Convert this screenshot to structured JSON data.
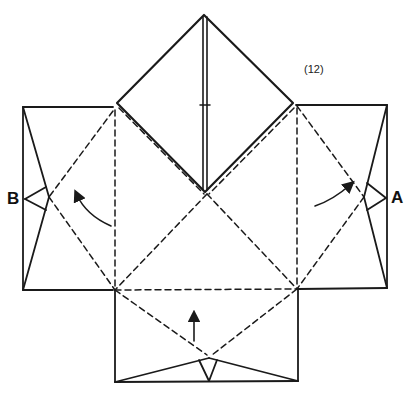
{
  "diagram": {
    "type": "origami-folding-step",
    "step_number": "(12)",
    "labels": {
      "left_point": "B",
      "right_point": "A"
    },
    "colors": {
      "line": "#1a1a1a",
      "background": "#ffffff"
    },
    "elements": {
      "top_diamond": "folded square flap with center crease",
      "left_panel": "rectangle with point B folded inward",
      "right_panel": "rectangle with point A folded inward",
      "bottom_panel": "rectangle with bottom point folded up",
      "valley_folds": "dashed diagonal fold lines forming a square",
      "arrows": [
        "curved arrow left (fold B in)",
        "curved arrow right (fold A in)",
        "straight arrow up (fold bottom up)"
      ]
    }
  }
}
